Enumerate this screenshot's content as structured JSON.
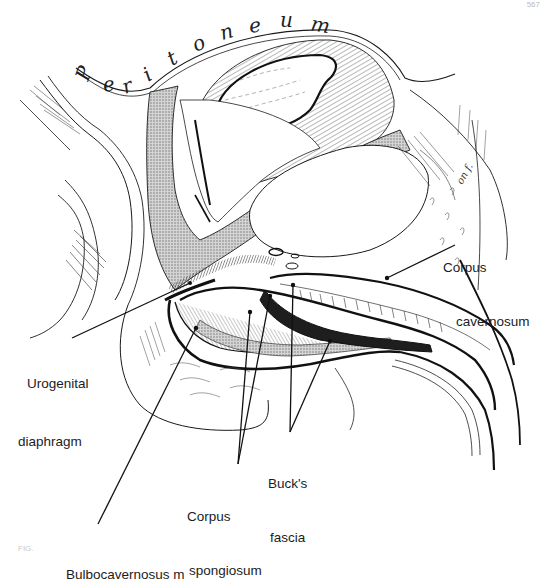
{
  "page": {
    "number": "567",
    "caption_fragment": "FIG."
  },
  "figure": {
    "type": "anatomical sagittal section illustration",
    "peritoneum_label": {
      "text": "Peritoneum",
      "letters": [
        "P",
        "e",
        "r",
        "i",
        "t",
        "o",
        "n",
        "e",
        "u",
        "m"
      ]
    },
    "artist_signature": "on f.",
    "colors": {
      "ink": "#1a1a1a",
      "stipple_fill": "#b8b8b8",
      "background": "#ffffff"
    }
  },
  "labels": {
    "corpus_cavernosum": {
      "line1": "Corpus",
      "line2": "cavernosum"
    },
    "urogenital_diaphragm": {
      "line1": "Urogenital",
      "line2": "diaphragm"
    },
    "bucks_fascia": {
      "line1": "Buck's",
      "line2": "fascia"
    },
    "corpus_spongiosum": {
      "line1": "Corpus",
      "line2": "spongiosum"
    },
    "bulbocavernosus": {
      "line1": "Bulbocavernosus m"
    }
  },
  "leader_lines": [
    {
      "label": "Corpus cavernosum",
      "from": [
        455,
        245
      ],
      "to": [
        387,
        278
      ]
    },
    {
      "label": "Urogenital diaphragm",
      "from": [
        72,
        338
      ],
      "to": [
        190,
        283
      ]
    },
    {
      "label": "Buck's fascia",
      "from": [
        290,
        432
      ],
      "to": [
        330,
        341
      ]
    },
    {
      "label": "Buck's fascia",
      "from": [
        290,
        432
      ],
      "to": [
        293,
        285
      ]
    },
    {
      "label": "Corpus spongiosum",
      "from": [
        238,
        464
      ],
      "to": [
        250,
        312
      ]
    },
    {
      "label": "Corpus spongiosum",
      "from": [
        238,
        464
      ],
      "to": [
        270,
        296
      ]
    },
    {
      "label": "Bulbocavernosus m",
      "from": [
        98,
        524
      ],
      "to": [
        196,
        328
      ]
    }
  ]
}
